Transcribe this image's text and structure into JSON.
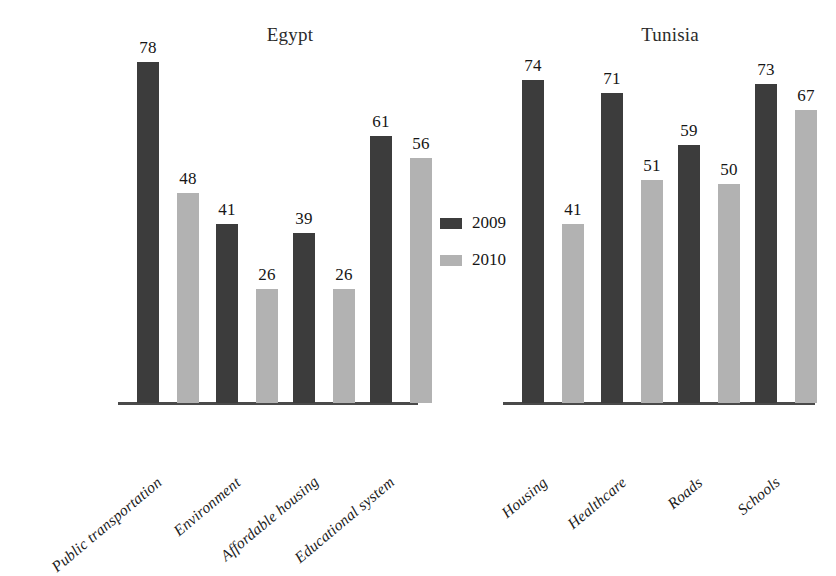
{
  "chart_data": {
    "type": "bar",
    "title": "",
    "xlabel": "",
    "ylabel": "",
    "ylim": [
      0,
      80
    ],
    "grid": false,
    "legend_position": "center",
    "panels": [
      {
        "title": "Egypt",
        "categories": [
          "Public transportation",
          "Environment",
          "Affordable housing",
          "Educational system"
        ],
        "series": [
          {
            "name": "2009",
            "color": "#3c3c3c",
            "values": [
              78,
              41,
              39,
              61
            ]
          },
          {
            "name": "2010",
            "color": "#b2b2b2",
            "values": [
              48,
              26,
              26,
              56
            ]
          }
        ]
      },
      {
        "title": "Tunisia",
        "categories": [
          "Housing",
          "Healthcare",
          "Roads",
          "Schools"
        ],
        "series": [
          {
            "name": "2009",
            "color": "#3c3c3c",
            "values": [
              74,
              71,
              59,
              73
            ]
          },
          {
            "name": "2010",
            "color": "#b2b2b2",
            "values": [
              41,
              51,
              50,
              67
            ]
          }
        ]
      }
    ],
    "legend": [
      {
        "label": "2009",
        "color": "#3c3c3c"
      },
      {
        "label": "2010",
        "color": "#b2b2b2"
      }
    ]
  },
  "layout": {
    "baseline_y": 403,
    "px_per_unit": 4.37,
    "bar_width": 22,
    "pair_gap": 18,
    "axis_color": "#4a4a4a",
    "background": "#ffffff",
    "panel_axes": [
      {
        "x": 118,
        "width": 300
      },
      {
        "x": 503,
        "width": 312
      }
    ],
    "panel_title_positions": [
      {
        "x": 290,
        "y": 24
      },
      {
        "x": 670,
        "y": 24
      }
    ],
    "group_starts": [
      [
        137,
        216,
        293,
        370
      ],
      [
        522,
        601,
        678,
        755
      ]
    ],
    "legend_x": 440,
    "legend_rows_y": [
      213,
      250
    ]
  }
}
